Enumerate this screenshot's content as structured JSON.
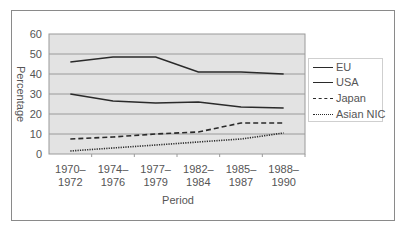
{
  "chart_data": {
    "type": "line",
    "title": "",
    "xlabel": "Period",
    "ylabel": "Percentage",
    "ylim": [
      0,
      60
    ],
    "yticks": [
      0,
      10,
      20,
      30,
      40,
      50,
      60
    ],
    "grid": true,
    "legend_position": "right",
    "categories": [
      "1970–1972",
      "1974–1976",
      "1977–1979",
      "1982–1984",
      "1985–1987",
      "1988–1990"
    ],
    "category_labels": [
      [
        "1970–",
        "1972"
      ],
      [
        "1974–",
        "1976"
      ],
      [
        "1977–",
        "1979"
      ],
      [
        "1982–",
        "1984"
      ],
      [
        "1985–",
        "1987"
      ],
      [
        "1988–",
        "1990"
      ]
    ],
    "series": [
      {
        "name": "EU",
        "style": "solid",
        "values": [
          46,
          48.5,
          48.5,
          41,
          41,
          40
        ]
      },
      {
        "name": "USA",
        "style": "solid",
        "values": [
          30,
          26.5,
          25.5,
          26,
          23.5,
          23
        ]
      },
      {
        "name": "Japan",
        "style": "dashed",
        "values": [
          7.5,
          8.5,
          10,
          11,
          15.5,
          15.5
        ]
      },
      {
        "name": "Asian NIC",
        "style": "dotted",
        "values": [
          1.5,
          3,
          4.5,
          6,
          7.5,
          10.5
        ]
      }
    ]
  },
  "labels": {
    "ytick_0": "0",
    "ytick_10": "10",
    "ytick_20": "20",
    "ytick_30": "30",
    "ytick_40": "40",
    "ytick_50": "50",
    "ytick_60": "60",
    "xlabel": "Period",
    "ylabel": "Percentage"
  },
  "legend": [
    {
      "label": "EU",
      "style": "solid"
    },
    {
      "label": "USA",
      "style": "solid"
    },
    {
      "label": "Japan",
      "style": "dashed"
    },
    {
      "label": "Asian NIC",
      "style": "dotted"
    }
  ],
  "colors": {
    "plot_bg": "#e3e3e3",
    "grid": "#9a9a9a",
    "line": "#2a2a2a",
    "frame": "#8a8a8a"
  }
}
